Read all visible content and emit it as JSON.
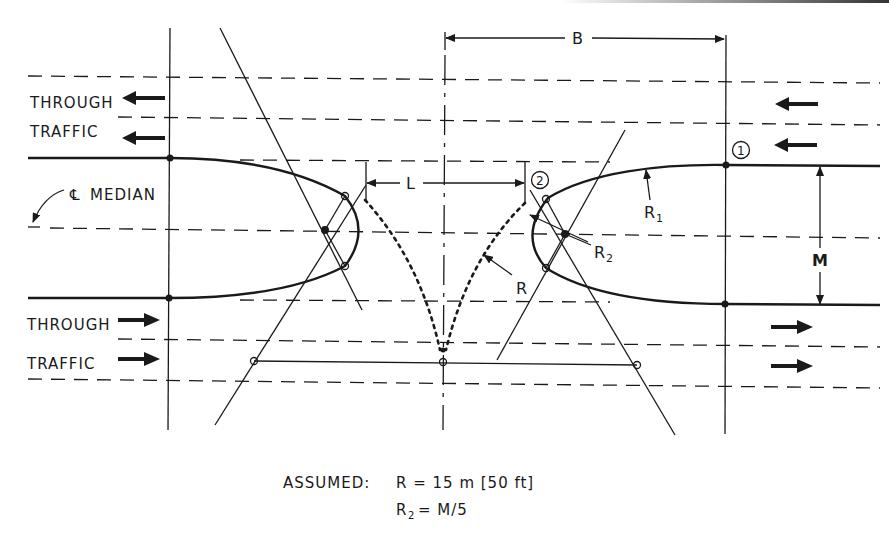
{
  "diagram": {
    "type": "median-opening-design",
    "labels": {
      "through_traffic_top_line1": "THROUGH",
      "through_traffic_top_line2": "TRAFFIC",
      "through_traffic_bottom_line1": "THROUGH",
      "through_traffic_bottom_line2": "TRAFFIC",
      "centerline_median": "MEDIAN",
      "centerline_symbol": "℄",
      "dim_B": "B",
      "dim_L": "L",
      "dim_M": "M",
      "radius_R": "R",
      "radius_R1": "R",
      "radius_R1_sub": "1",
      "radius_R2": "R",
      "radius_R2_sub": "2",
      "point_1": "1",
      "point_2": "2"
    },
    "assumptions": {
      "prefix": "ASSUMED:",
      "line1": "R = 15 m [50 ft]",
      "line2_lhs": "R",
      "line2_sub": "2",
      "line2_rhs": "= M/5"
    },
    "arrows": {
      "top_lanes_direction": "left",
      "bottom_lanes_direction": "right",
      "count_per_side": 2
    },
    "colors": {
      "ink": "#1a1a1a",
      "background": "#ffffff"
    }
  }
}
